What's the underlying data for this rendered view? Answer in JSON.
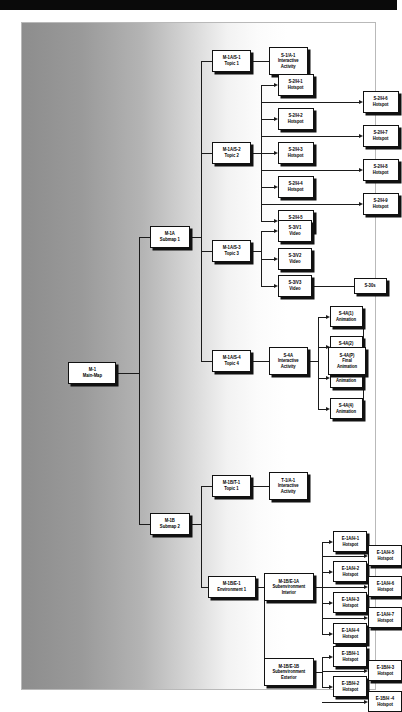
{
  "diagram": {
    "background": {
      "top_bar_color": "#0a0a0a",
      "gradient_from": "#8d8d8d",
      "gradient_to": "#ffffff",
      "box_fill": "#ffffff",
      "box_border": "#111111",
      "line_color": "#1b1b1b"
    },
    "nodes": [
      {
        "id": "m1",
        "code": "M-1",
        "label": "Main-Map"
      },
      {
        "id": "m1a",
        "code": "M-1A",
        "label": "Submap 1"
      },
      {
        "id": "m1b",
        "code": "M-1B",
        "label": "Submap 2"
      },
      {
        "id": "m1a_s1",
        "code": "M-1A/S-1",
        "label": "Topic 1"
      },
      {
        "id": "s1_a1",
        "code": "S-1/A-1",
        "label": "Interactive\nActivity"
      },
      {
        "id": "m1a_s2",
        "code": "M-1A/S-2",
        "label": "Topic 2"
      },
      {
        "id": "s2_h1",
        "code": "S-2/H-1",
        "label": "Hotspot"
      },
      {
        "id": "s2_h2",
        "code": "S-2/H-2",
        "label": "Hotspot"
      },
      {
        "id": "s2_h3",
        "code": "S-2/H-3",
        "label": "Hotspot"
      },
      {
        "id": "s2_h4",
        "code": "S-2/H-4",
        "label": "Hotspot"
      },
      {
        "id": "s2_h5",
        "code": "S-2/H-5",
        "label": "Hotspot"
      },
      {
        "id": "s2_h6",
        "code": "S-2/H-6",
        "label": "Hotspot"
      },
      {
        "id": "s2_h7",
        "code": "S-2/H-7",
        "label": "Hotspot"
      },
      {
        "id": "s2_h8",
        "code": "S-2/H-8",
        "label": "Hotspot"
      },
      {
        "id": "s2_h9",
        "code": "S-2/H-9",
        "label": "Hotspot"
      },
      {
        "id": "m1a_s3",
        "code": "M-1A/S-3",
        "label": "Topic 3"
      },
      {
        "id": "s3_v1",
        "code": "S-3/V1",
        "label": "Video"
      },
      {
        "id": "s3_v2",
        "code": "S-3/V2",
        "label": "Video"
      },
      {
        "id": "s3_v3",
        "code": "S-3/V3",
        "label": "Video"
      },
      {
        "id": "s30s",
        "code": "S-30s",
        "label": ""
      },
      {
        "id": "m1a_s4",
        "code": "M-1A/S-4",
        "label": "Topic 4"
      },
      {
        "id": "s4a",
        "code": "S-4A",
        "label": "Interactive\nActivity"
      },
      {
        "id": "s4a1",
        "code": "S-4A(1)",
        "label": "Animation"
      },
      {
        "id": "s4a2",
        "code": "S-4A(2)",
        "label": "Animation"
      },
      {
        "id": "s4a3",
        "code": "S-4A(3)",
        "label": "Animation"
      },
      {
        "id": "s4a4",
        "code": "S-4A(4)",
        "label": "Animation"
      },
      {
        "id": "s4ap",
        "code": "S-4A(P)",
        "label": "Final\nAnimation"
      },
      {
        "id": "m1b_t1",
        "code": "M-1B/T-1",
        "label": "Topic 1"
      },
      {
        "id": "t1_a1",
        "code": "T-1/A-1",
        "label": "Interactive\nActivity"
      },
      {
        "id": "m1b_e1",
        "code": "M-1B/E-1",
        "label": "Environment 1"
      },
      {
        "id": "m1b_e1a",
        "code": "M-1B/E-1A",
        "label": "Subenvironment\nInterior"
      },
      {
        "id": "e1a_h1",
        "code": "E-1A/H-1",
        "label": "Hotspot"
      },
      {
        "id": "e1a_h2",
        "code": "E-1A/H-2",
        "label": "Hotspot"
      },
      {
        "id": "e1a_h3",
        "code": "E-1A/H-3",
        "label": "Hotspot"
      },
      {
        "id": "e1a_h4",
        "code": "E-1A/H-4",
        "label": "Hotspot"
      },
      {
        "id": "e1a_h5",
        "code": "E-1A/H-5",
        "label": "Hotspot"
      },
      {
        "id": "e1a_h6",
        "code": "E-1A/H-6",
        "label": "Hotspot"
      },
      {
        "id": "e1a_h7",
        "code": "E-1A/H-7",
        "label": "Hotspot"
      },
      {
        "id": "m1b_e1b",
        "code": "M-1B/E-1B",
        "label": "Subenvironment\nExterior"
      },
      {
        "id": "e1b_h1",
        "code": "E-1B/H-1",
        "label": "Hotspot"
      },
      {
        "id": "e1b_h2",
        "code": "E-1B/H-2",
        "label": "Hotspot"
      },
      {
        "id": "e1b_h3",
        "code": "E-1B/H-3",
        "label": "Hotspot"
      },
      {
        "id": "e1b_h4",
        "code": "E-1B/H -4",
        "label": "Hotspot"
      }
    ]
  }
}
